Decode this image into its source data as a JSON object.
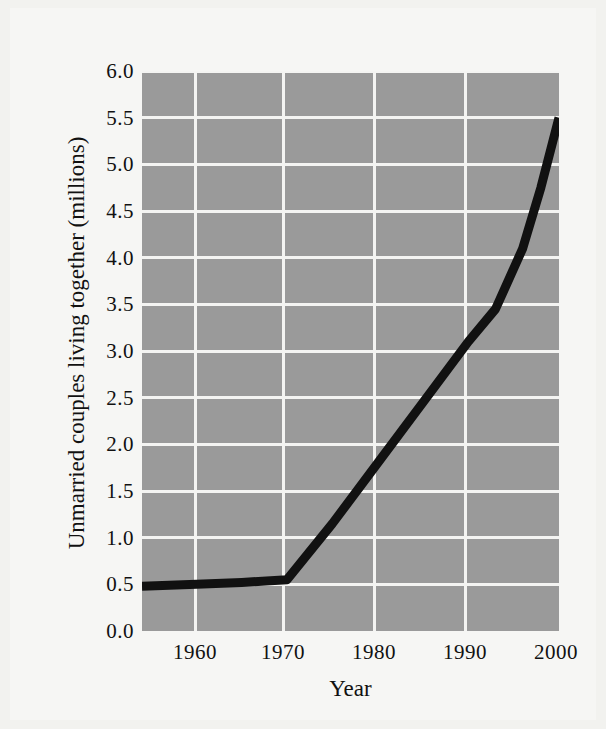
{
  "figure": {
    "background_color": "#f6f6f4",
    "plot_background_color": "#9a9a9a",
    "gridline_color": "#f4f4f2",
    "line_color": "#111111",
    "text_color": "#111111"
  },
  "chart_data": {
    "type": "line",
    "title": "",
    "xlabel": "Year",
    "ylabel": "Unmarried couples living together (millions)",
    "xlim": [
      1954,
      2000
    ],
    "ylim": [
      0.0,
      6.0
    ],
    "grid": true,
    "legend": "none",
    "xticks": [
      1960,
      1970,
      1980,
      1990,
      2000
    ],
    "xtick_labels": [
      "1960",
      "1970",
      "1980",
      "1990",
      "2000"
    ],
    "yticks": [
      0.0,
      0.5,
      1.0,
      1.5,
      2.0,
      2.5,
      3.0,
      3.5,
      4.0,
      4.5,
      5.0,
      5.5,
      6.0
    ],
    "ytick_labels": [
      "0.0",
      "0.5",
      "1.0",
      "1.5",
      "2.0",
      "2.5",
      "3.0",
      "3.5",
      "4.0",
      "4.5",
      "5.0",
      "5.5",
      "6.0"
    ],
    "series": [
      {
        "name": "Unmarried couples living together",
        "x": [
          1954,
          1960,
          1965,
          1970,
          1975,
          1980,
          1985,
          1990,
          1993,
          1996,
          1998,
          2000
        ],
        "values": [
          0.48,
          0.5,
          0.52,
          0.55,
          1.15,
          1.8,
          2.45,
          3.1,
          3.45,
          4.1,
          4.75,
          5.5
        ]
      }
    ]
  },
  "axis": {
    "x_title": "Year",
    "y_title": "Unmarried couples living together (millions)"
  }
}
